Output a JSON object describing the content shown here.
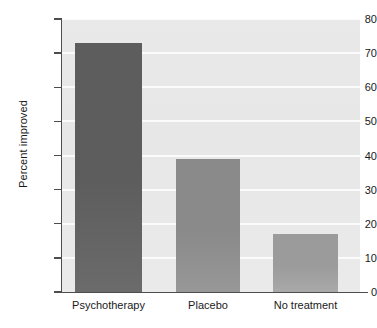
{
  "chart_data": {
    "type": "bar",
    "title": "",
    "xlabel": "",
    "ylabel": "Percent improved",
    "categories": [
      "Psychotherapy",
      "Placebo",
      "No treatment"
    ],
    "values": [
      73,
      39,
      17
    ],
    "ylim": [
      0,
      80
    ],
    "yticks": [
      0,
      10,
      20,
      30,
      40,
      50,
      60,
      70,
      80
    ],
    "ytick_labels": [
      "0",
      "10",
      "20",
      "30",
      "40",
      "50",
      "60",
      "70",
      "80"
    ],
    "grid": "horizontal",
    "legend": "none",
    "bar_colors": [
      "#5d5d5d",
      "#8a8a8a",
      "#9b9b9b"
    ],
    "plot_background": "#e8e8e8",
    "gridline_color": "#fbfbfb",
    "axis_color": "#4d4d4d",
    "text_color": "#1a1a1a"
  }
}
